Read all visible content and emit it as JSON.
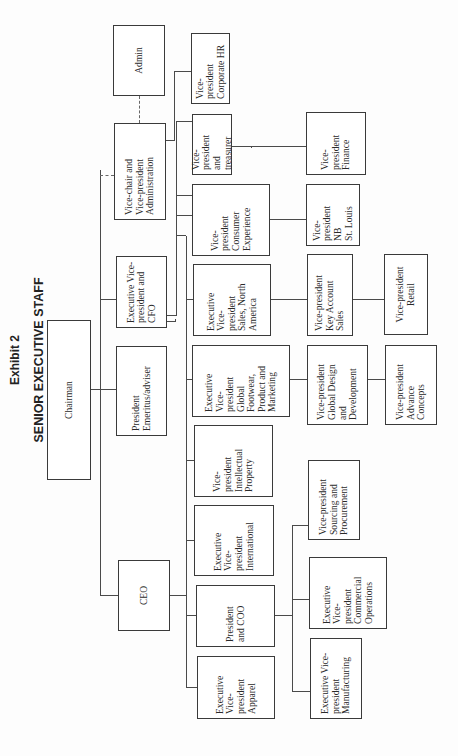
{
  "exhibit_label": "Exhibit 2",
  "chart_title": "SENIOR EXECUTIVE STAFF",
  "org_chart": {
    "root": "Chairman",
    "level1": [
      "CEO",
      "President Emeritus/adviser",
      "Executive Vice-president and CFO",
      "Vice-chair and Vice-president Administration"
    ],
    "nodes": {
      "chairman": "Chairman",
      "ceo": "CEO",
      "president_emeritus": "President\nEmeritus/adviser",
      "evp_cfo": "Executive Vice-\npresident and\nCFO",
      "vice_chair": "Vice-chair and\nVice-president\nAdministration",
      "admin": "Admin",
      "vp_corporate_hr": "Vice-\npresident\nCorporate HR",
      "vp_treasurer": "Vice-\npresident\nand\ntreasurer",
      "vp_finance": "Vice-\npresident\nFinance",
      "vp_consumer_experience": "Vice-\npresident\nConsumer\nExperience",
      "vp_nb_st_louis": "Vice-\npresident\nNB\nSt. Louis",
      "evp_sales_na": "Executive\nVice-\npresident\nSales, North\nAmerica",
      "vp_key_account_sales": "Vice-president\nKey Account\nSales",
      "vp_retail": "Vice-president\nRetail",
      "evp_global_footwear": "Executive\nVice-\npresident\nGlobal\nFootwear,\nProduct and\nMarketing",
      "vp_global_design": "Vice-president\nGlobal Design\nand\nDevelopment",
      "vp_advance_concepts": "Vice-president\nAdvance\nConcepts",
      "vp_intellectual_property": "Vice-\npresident\nIntellectual\nProperty",
      "evp_international": "Executive\nVice-\npresident\nInternational",
      "vp_sourcing": "Vice-president\nSourcing and\nProcurement",
      "president_coo": "President\nand COO",
      "evp_commercial_operations": "Executive\nVice-\npresident\nCommercial\nOperations",
      "evp_apparel": "Executive\nVice-\npresident\nApparel",
      "evp_manufacturing": "Executive Vice-\npresident\nManufacturing"
    },
    "reporting": {
      "Chairman": [
        "CEO",
        "President Emeritus/adviser",
        "Executive Vice-president and CFO",
        "Vice-chair and Vice-president Administration"
      ],
      "Vice-chair and Vice-president Administration": [
        "Vice-president Corporate HR",
        "Admin (dotted)"
      ],
      "Executive Vice-president and CFO": [
        "Vice-president and treasurer",
        "Vice-president Consumer Experience"
      ],
      "Vice-president and treasurer": [
        "Vice-president Finance"
      ],
      "Vice-president Consumer Experience": [
        "Vice-president NB St. Louis"
      ],
      "CEO": [
        "Executive Vice-president Sales, North America",
        "Executive Vice-president Global Footwear, Product and Marketing",
        "Vice-president Intellectual Property",
        "Executive Vice-president International",
        "President and COO",
        "Executive Vice-president Apparel"
      ],
      "Executive Vice-president Sales, North America": [
        "Vice-president Key Account Sales"
      ],
      "Vice-president Key Account Sales": [
        "Vice-president Retail"
      ],
      "Executive Vice-president Global Footwear, Product and Marketing": [
        "Vice-president Global Design and Development"
      ],
      "Vice-president Global Design and Development": [
        "Vice-president Advance Concepts"
      ],
      "President and COO": [
        "Vice-president Sourcing and Procurement",
        "Executive Vice-president Commercial Operations",
        "Executive Vice-president Manufacturing"
      ]
    }
  }
}
